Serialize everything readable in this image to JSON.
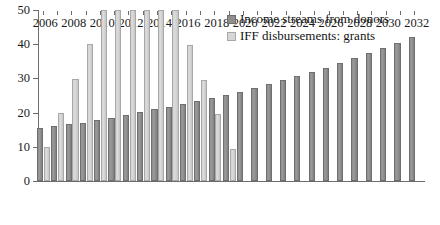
{
  "chart_data": {
    "type": "bar",
    "title": "",
    "xlabel": "",
    "ylabel": "",
    "ylim": [
      0,
      50
    ],
    "ytick_values": [
      0,
      10,
      20,
      30,
      40,
      50
    ],
    "ytick_labels": [
      "0",
      "10",
      "20",
      "30",
      "40",
      "50"
    ],
    "grid": false,
    "legend_position": "top-right",
    "note_clipped": "IFF disbursements bars for 2010-2015 are clipped at the axis maximum of 50",
    "categories": [
      2006,
      2007,
      2008,
      2009,
      2010,
      2011,
      2012,
      2013,
      2014,
      2015,
      2016,
      2017,
      2018,
      2019,
      2020,
      2021,
      2022,
      2023,
      2024,
      2025,
      2026,
      2027,
      2028,
      2029,
      2030,
      2031,
      2032
    ],
    "xtick_labels": [
      "2006",
      "",
      "2008",
      "",
      "2010",
      "",
      "2012",
      "",
      "2014",
      "",
      "2016",
      "",
      "2018",
      "",
      "2020",
      "",
      "2022",
      "",
      "2024",
      "",
      "2026",
      "",
      "2028",
      "",
      "2030",
      "",
      "2032"
    ],
    "series": [
      {
        "name": "Income streams from donors",
        "color": "#8e8e8e",
        "values": [
          15.4,
          16.1,
          16.6,
          17.1,
          17.9,
          18.5,
          19.3,
          20.1,
          21.0,
          21.6,
          22.6,
          23.4,
          24.3,
          25.1,
          26.1,
          27.2,
          28.4,
          29.6,
          30.7,
          31.9,
          33.1,
          34.5,
          36.0,
          37.3,
          38.9,
          40.4,
          42.0
        ]
      },
      {
        "name": "IFF disbursements: grants",
        "color": "#d6d6d6",
        "values": [
          9.9,
          19.8,
          29.8,
          40.0,
          50.0,
          50.0,
          50.0,
          50.0,
          50.0,
          50.0,
          39.7,
          29.5,
          19.5,
          9.4,
          null,
          null,
          null,
          null,
          null,
          null,
          null,
          null,
          null,
          null,
          null,
          null,
          null
        ]
      }
    ]
  },
  "legend": {
    "entries": [
      {
        "label": "Income streams from donors",
        "swatch": "dark"
      },
      {
        "label": "IFF disbursements: grants",
        "swatch": "light"
      }
    ]
  }
}
